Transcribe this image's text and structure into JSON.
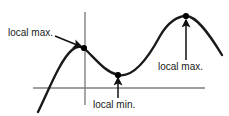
{
  "figure": {
    "width": 229,
    "height": 116,
    "background_color": "#ffffff",
    "curve_color": "#1a1a1a",
    "axis_color": "#808080",
    "label_color": "#1a1a1a",
    "point_color": "#000000"
  },
  "labels": {
    "local_max_left": "local max.",
    "local_min": "local min.",
    "local_max_right": "local max."
  },
  "chart_data": {
    "type": "line",
    "title": "",
    "xlabel": "",
    "ylabel": "",
    "grid": false,
    "legend": false,
    "axes": {
      "x_axis": {
        "y": 88,
        "x_start": 33,
        "x_end": 205
      },
      "y_axis": {
        "x": 85,
        "y_start": 12,
        "y_end": 105
      }
    },
    "curve_path": "M 38 112 C 48 92 60 60 72 50 C 78 45 82 46 88 52 C 98 62 106 72 118 75 C 132 78 146 62 160 36 C 168 22 178 16 186 16 C 196 16 208 32 222 55",
    "annotations": [
      {
        "name": "local-max-left",
        "label": "local max.",
        "point": {
          "x": 84,
          "y": 48
        },
        "marker": "dot",
        "arrow": {
          "type": "diagonal",
          "from_x": 55,
          "from_y": 36,
          "to_x": 82,
          "to_y": 47
        }
      },
      {
        "name": "local-min",
        "label": "local min.",
        "point": {
          "x": 118,
          "y": 75
        },
        "marker": "dot",
        "arrow": {
          "type": "vertical",
          "from_x": 118,
          "from_y": 98,
          "to_x": 118,
          "to_y": 78
        }
      },
      {
        "name": "local-max-right",
        "label": "local max.",
        "point": {
          "x": 186,
          "y": 16
        },
        "marker": "dot",
        "arrow": {
          "type": "vertical",
          "from_x": 186,
          "from_y": 60,
          "to_x": 186,
          "to_y": 20
        }
      }
    ]
  }
}
